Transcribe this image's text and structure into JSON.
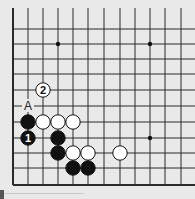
{
  "diagram": {
    "type": "go-board-corner",
    "board_color": "#e9e9e9",
    "line_color": "#2a2a2a",
    "grid": {
      "x_lines": [
        13,
        28,
        43,
        58,
        73,
        88,
        104,
        120,
        135,
        150,
        165,
        181
      ],
      "y_lines": [
        29,
        44,
        59,
        74,
        90,
        106,
        122,
        138,
        153,
        168,
        185
      ],
      "left_edge": true,
      "bottom_edge": true
    },
    "star_points": [
      {
        "col": 3,
        "row": 1
      },
      {
        "col": 9,
        "row": 1
      },
      {
        "col": 9,
        "row": 7
      }
    ],
    "stones": [
      {
        "color": "black",
        "col": 1,
        "row": 6,
        "label": ""
      },
      {
        "color": "white",
        "col": 2,
        "row": 6,
        "label": ""
      },
      {
        "color": "white",
        "col": 3,
        "row": 6,
        "label": ""
      },
      {
        "color": "white",
        "col": 4,
        "row": 6,
        "label": ""
      },
      {
        "color": "black",
        "col": 1,
        "row": 7,
        "label": "1"
      },
      {
        "color": "black",
        "col": 3,
        "row": 7,
        "label": ""
      },
      {
        "color": "black",
        "col": 3,
        "row": 8,
        "label": ""
      },
      {
        "color": "white",
        "col": 4,
        "row": 8,
        "label": ""
      },
      {
        "color": "white",
        "col": 5,
        "row": 8,
        "label": ""
      },
      {
        "color": "white",
        "col": 7,
        "row": 8,
        "label": ""
      },
      {
        "color": "black",
        "col": 4,
        "row": 9,
        "label": ""
      },
      {
        "color": "black",
        "col": 5,
        "row": 9,
        "label": ""
      },
      {
        "color": "white",
        "col": 2,
        "row": 4,
        "label": "2"
      }
    ],
    "markers": [
      {
        "text": "A",
        "col": 1,
        "row": 5
      }
    ]
  }
}
